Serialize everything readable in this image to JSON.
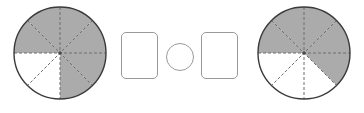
{
  "figure": {
    "background_color": "#ffffff",
    "width": 364,
    "height": 113
  },
  "style": {
    "shaded_fill": "#ababab",
    "unshaded_fill": "#ffffff",
    "outline_color": "#3a3a3a",
    "radius_line_color": "#6e6e6e",
    "box_border_color": "#9a9a9a",
    "box_fill": "#ffffff"
  },
  "left_model": {
    "name": "left-fraction-circle",
    "shape": "circle",
    "total_parts": 8,
    "shaded_parts": 6,
    "unshaded_parts": 2,
    "fraction_text": "6/8",
    "center_x": 60,
    "center_y": 53,
    "radius": 46,
    "sector_shaded": [
      true,
      true,
      true,
      true,
      true,
      true,
      false,
      false
    ],
    "shaded_region_note": "top half and bottom-right quadrant shaded",
    "divider_count": 8,
    "divider_style": "dashed"
  },
  "right_model": {
    "name": "right-fraction-circle",
    "shape": "circle",
    "total_parts": 8,
    "shaded_parts": 5,
    "unshaded_parts": 3,
    "fraction_text": "5/8",
    "center_x": 304,
    "center_y": 53,
    "radius": 46,
    "sector_shaded": [
      true,
      true,
      true,
      true,
      true,
      false,
      false,
      false
    ],
    "shaded_region_note": "top half and one bottom-right eighth shaded",
    "divider_count": 8,
    "divider_style": "dashed"
  },
  "answer_slots": {
    "first_box": {
      "label": "first-answer-box",
      "value": "",
      "placeholder": ""
    },
    "operator_circle": {
      "label": "comparison-operator-circle",
      "value": "",
      "placeholder": ""
    },
    "second_box": {
      "label": "second-answer-box",
      "value": "",
      "placeholder": ""
    }
  }
}
